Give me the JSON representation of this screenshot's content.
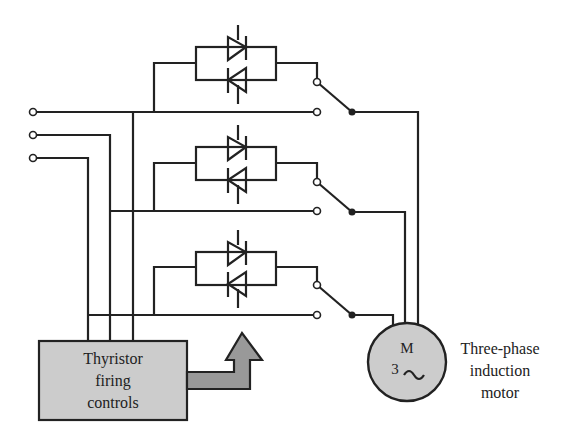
{
  "diagram": {
    "controls_box": {
      "label_lines": [
        "Thyristor",
        "firing",
        "controls"
      ],
      "fill": "#cccccc"
    },
    "motor": {
      "symbol": "M",
      "phase_symbol": "3",
      "ac_symbol": "~",
      "label_lines": [
        "Three-phase",
        "induction",
        "motor"
      ],
      "fill": "#cccccc"
    },
    "arrow": {
      "fill": "#999999"
    },
    "line_color": "#222222",
    "phases": [
      {
        "name": "phase-1",
        "bus_y": 112,
        "box_top": 47,
        "switch_top_y": 82,
        "motor_wire_x": 418
      },
      {
        "name": "phase-2",
        "bus_y": 211,
        "box_top": 147,
        "switch_top_y": 182,
        "motor_wire_x": 405
      },
      {
        "name": "phase-3",
        "bus_y": 315,
        "box_top": 252,
        "switch_top_y": 285,
        "motor_wire_x": 393
      }
    ],
    "input_terminals": [
      {
        "name": "terminal-1",
        "y": 112
      },
      {
        "name": "terminal-2",
        "y": 135
      },
      {
        "name": "terminal-3",
        "y": 158
      }
    ]
  }
}
